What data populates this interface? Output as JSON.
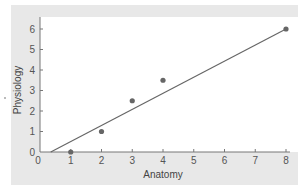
{
  "chart_data": {
    "type": "scatter",
    "title": "",
    "xlabel": "Anatomy",
    "ylabel": "Physiology",
    "xlim": [
      0,
      8
    ],
    "ylim": [
      0,
      6
    ],
    "x_ticks": [
      "0",
      "1",
      "2",
      "3",
      "4",
      "5",
      "6",
      "7",
      "8"
    ],
    "y_ticks": [
      "0",
      "1",
      "2",
      "3",
      "4",
      "5",
      "6"
    ],
    "grid": false,
    "legend": null,
    "series": [
      {
        "name": "observations",
        "type": "scatter",
        "points": [
          {
            "x": 1,
            "y": 0
          },
          {
            "x": 2,
            "y": 1
          },
          {
            "x": 3,
            "y": 2.5
          },
          {
            "x": 4,
            "y": 3.5
          },
          {
            "x": 8,
            "y": 6
          }
        ]
      },
      {
        "name": "regression line",
        "type": "line",
        "points": [
          {
            "x": 0.35,
            "y": 0
          },
          {
            "x": 8,
            "y": 6
          }
        ]
      }
    ],
    "colors": {
      "points": "#666666",
      "line": "#666666",
      "panel_background": "#e8e8e8",
      "plot_background": "#ffffff",
      "axis": "#777777"
    }
  }
}
